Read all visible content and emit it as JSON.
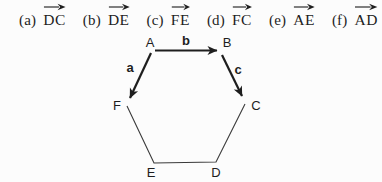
{
  "options": [
    {
      "label": "(a)",
      "vector": "DC"
    },
    {
      "label": "(b)",
      "vector": "DE"
    },
    {
      "label": "(c)",
      "vector": "FE"
    },
    {
      "label": "(d)",
      "vector": "FC"
    },
    {
      "label": "(e)",
      "vector": "AE"
    },
    {
      "label": "(f)",
      "vector": "AD"
    }
  ],
  "diagram": {
    "vertex_labels": {
      "A": "A",
      "B": "B",
      "C": "C",
      "D": "D",
      "E": "E",
      "F": "F"
    },
    "vector_labels": {
      "a": "a",
      "b": "b",
      "c": "c"
    }
  },
  "colors": {
    "ink": "#1e1e1e",
    "paper": "#fcfcfc"
  }
}
